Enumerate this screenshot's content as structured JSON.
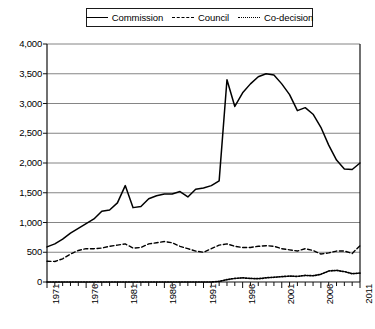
{
  "legend": {
    "position": "top-center",
    "entries": [
      {
        "label": "Commission",
        "style": "solid",
        "swatch_name": "legend-swatch-commission"
      },
      {
        "label": "Council",
        "style": "dashed",
        "swatch_name": "legend-swatch-council"
      },
      {
        "label": "Co-decision",
        "style": "dotted",
        "swatch_name": "legend-swatch-codecision"
      }
    ]
  },
  "chart_data": {
    "type": "line",
    "title": "",
    "subtitle": "",
    "xlabel": "",
    "ylabel": "",
    "xlim": [
      1971,
      2011
    ],
    "ylim": [
      0,
      4000
    ],
    "grid": true,
    "grid_axis": "y",
    "legend_position": "top-center",
    "y_ticks": [
      0,
      500,
      1000,
      1500,
      2000,
      2500,
      3000,
      3500,
      4000
    ],
    "y_tick_labels": [
      "0",
      "500",
      "1,000",
      "1,500",
      "2,000",
      "2,500",
      "3,000",
      "3,500",
      "4,000"
    ],
    "x_major_ticks": [
      1971,
      1976,
      1981,
      1986,
      1991,
      1996,
      2001,
      2006,
      2011
    ],
    "x_major_tick_labels": [
      "1971",
      "1976",
      "1981",
      "1986",
      "1991",
      "1996",
      "2001",
      "2006",
      "2011"
    ],
    "x_minor_tick_interval": 1,
    "x": [
      1971,
      1972,
      1973,
      1974,
      1975,
      1976,
      1977,
      1978,
      1979,
      1980,
      1981,
      1982,
      1983,
      1984,
      1985,
      1986,
      1987,
      1988,
      1989,
      1990,
      1991,
      1992,
      1993,
      1994,
      1995,
      1996,
      1997,
      1998,
      1999,
      2000,
      2001,
      2002,
      2003,
      2004,
      2005,
      2006,
      2007,
      2008,
      2009,
      2010,
      2011
    ],
    "series": [
      {
        "name": "Commission",
        "style": "solid",
        "color": "#000000",
        "values": [
          590,
          640,
          720,
          820,
          900,
          980,
          1060,
          1190,
          1210,
          1330,
          1620,
          1250,
          1270,
          1400,
          1450,
          1480,
          1480,
          1520,
          1430,
          1560,
          1580,
          1620,
          1700,
          3400,
          2950,
          3180,
          3330,
          3450,
          3500,
          3480,
          3330,
          3150,
          2880,
          2930,
          2820,
          2600,
          2300,
          2050,
          1900,
          1890,
          2000
        ]
      },
      {
        "name": "Council",
        "style": "dashed",
        "color": "#000000",
        "values": [
          350,
          345,
          390,
          470,
          530,
          560,
          560,
          570,
          600,
          620,
          640,
          570,
          580,
          640,
          660,
          680,
          660,
          600,
          560,
          520,
          500,
          560,
          620,
          640,
          600,
          580,
          580,
          600,
          610,
          600,
          560,
          540,
          520,
          560,
          530,
          470,
          490,
          520,
          520,
          480,
          610
        ]
      },
      {
        "name": "Co-decision",
        "style": "dotted",
        "color": "#000000",
        "values": [
          0,
          0,
          0,
          0,
          0,
          0,
          0,
          0,
          0,
          0,
          0,
          0,
          0,
          0,
          0,
          0,
          0,
          0,
          0,
          0,
          0,
          0,
          10,
          40,
          60,
          70,
          60,
          55,
          70,
          80,
          90,
          100,
          95,
          110,
          105,
          130,
          185,
          195,
          175,
          140,
          150
        ]
      }
    ]
  }
}
